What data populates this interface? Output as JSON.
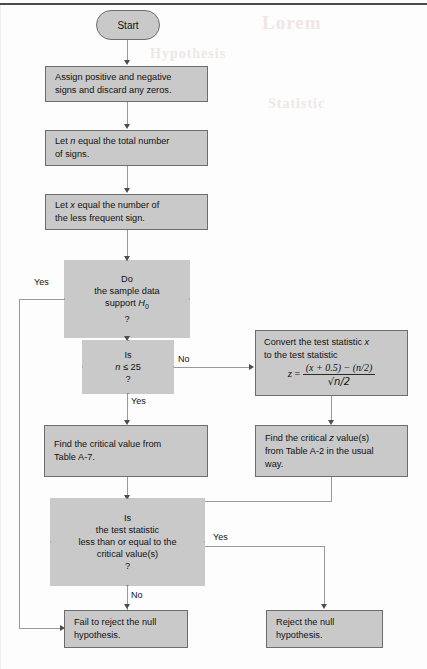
{
  "page": {
    "background_color": "#fdfdfd",
    "node_fill_color": "#c9c9c9",
    "node_border_color": "#6d6d6d",
    "connector_color": "#9a9a9a",
    "text_color": "#111111",
    "ghost_texts": [
      "Lorem",
      "Hypothesis",
      "Statistic"
    ]
  },
  "nodes": {
    "start": {
      "type": "terminal",
      "label": "Start"
    },
    "assign_signs": {
      "type": "process",
      "line1": "Assign positive and negative",
      "line2": "signs and discard any zeros."
    },
    "let_n": {
      "type": "process",
      "line1_a": "Let ",
      "line1_var": "n",
      "line1_b": " equal the total number",
      "line2": "of signs."
    },
    "let_x": {
      "type": "process",
      "line1_a": "Let ",
      "line1_var": "x",
      "line1_b": " equal the number of",
      "line2": "the less frequent sign."
    },
    "support_h0": {
      "type": "decision",
      "line1": "Do",
      "line2": "the sample data",
      "line3_a": "support ",
      "line3_var": "H",
      "line3_sub": "0",
      "line4": "?"
    },
    "n_le_25": {
      "type": "decision",
      "line1": "Is",
      "line2_var": "n",
      "line2_op": " ≤ 25",
      "line3": "?"
    },
    "convert_z": {
      "type": "process",
      "line1_a": "Convert the test statistic ",
      "line1_var": "x",
      "line2": "to the test statistic",
      "formula_lhs": "z",
      "formula_eq": "=",
      "formula_numerator": "(x + 0.5) − (n/2)",
      "formula_denominator": "√n/2"
    },
    "critical_value_a7": {
      "type": "process",
      "line1": "Find the critical value from",
      "line2": "Table A-7."
    },
    "critical_z_a2": {
      "type": "process",
      "line1_a": "Find the critical ",
      "line1_var": "z",
      "line1_b": " value(s)",
      "line2": "from Table A-2 in the usual",
      "line3": "way."
    },
    "test_stat_compare": {
      "type": "decision",
      "line1": "Is",
      "line2": "the test statistic",
      "line3": "less than or equal to the",
      "line4": "critical value(s)",
      "line5": "?"
    },
    "fail_reject": {
      "type": "process",
      "line1": "Fail to reject the null",
      "line2": "hypothesis."
    },
    "reject": {
      "type": "process",
      "line1": "Reject the null",
      "line2": "hypothesis."
    }
  },
  "edge_labels": {
    "support_h0_yes": "Yes",
    "support_h0_no": "No",
    "n_le_25_no": "No",
    "n_le_25_yes": "Yes",
    "compare_yes": "Yes",
    "compare_no": "No"
  }
}
